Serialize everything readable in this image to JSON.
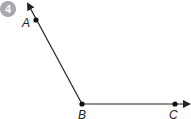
{
  "problem": {
    "number": "4",
    "badge_color": "#a7a9ac"
  },
  "diagram": {
    "type": "angle",
    "vertex": {
      "label": "B",
      "x": 82,
      "y": 104
    },
    "points": [
      {
        "label": "A",
        "x": 36,
        "y": 20
      },
      {
        "label": "C",
        "x": 175,
        "y": 104
      }
    ],
    "rays": [
      "BA",
      "BC"
    ],
    "line_color": "#222222"
  }
}
